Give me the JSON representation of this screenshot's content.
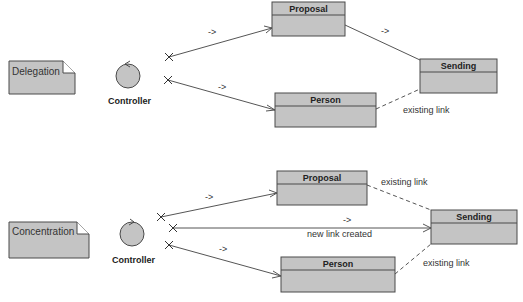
{
  "colors": {
    "fill": "#c4c4c4",
    "stroke": "#4a4a4a",
    "line": "#555555"
  },
  "top": {
    "note": "Delegation",
    "controller": "Controller",
    "classes": {
      "proposal": "Proposal",
      "person": "Person",
      "sending": "Sending"
    },
    "arrow_labels": [
      "->",
      "->",
      "->"
    ],
    "existing_link": "existing link"
  },
  "bottom": {
    "note": "Concentration",
    "controller": "Controller",
    "classes": {
      "proposal": "Proposal",
      "person": "Person",
      "sending": "Sending"
    },
    "arrow_labels": [
      "->",
      "->",
      "->"
    ],
    "new_link": "new link created",
    "existing_link_1": "existing link",
    "existing_link_2": "existing link"
  }
}
